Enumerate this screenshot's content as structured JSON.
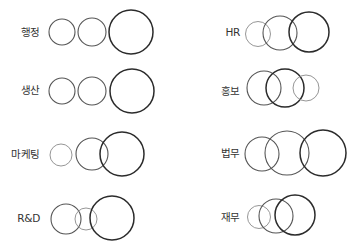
{
  "diagram": {
    "type": "venn-style circle groups by department",
    "stroke_colors": {
      "light": "#8a8a8a",
      "medium": "#555555",
      "dark": "#2b2b2b"
    },
    "groups": [
      {
        "label": "행정",
        "label_pos": {
          "x": 40,
          "y": 36,
          "anchor": "end"
        },
        "circles": [
          {
            "cx": 62,
            "cy": 32,
            "r": 13,
            "tone": "medium"
          },
          {
            "cx": 92,
            "cy": 32,
            "r": 14,
            "tone": "medium"
          },
          {
            "cx": 131,
            "cy": 32,
            "r": 22,
            "tone": "dark"
          }
        ]
      },
      {
        "label": "생산",
        "label_pos": {
          "x": 40,
          "y": 94,
          "anchor": "end"
        },
        "circles": [
          {
            "cx": 62,
            "cy": 91,
            "r": 13,
            "tone": "medium"
          },
          {
            "cx": 92,
            "cy": 91,
            "r": 14,
            "tone": "medium"
          },
          {
            "cx": 132,
            "cy": 91,
            "r": 22,
            "tone": "dark"
          }
        ]
      },
      {
        "label": "마케팅",
        "label_pos": {
          "x": 40,
          "y": 158,
          "anchor": "end"
        },
        "circles": [
          {
            "cx": 61,
            "cy": 155,
            "r": 11,
            "tone": "light"
          },
          {
            "cx": 92,
            "cy": 154,
            "r": 16,
            "tone": "medium"
          },
          {
            "cx": 122,
            "cy": 154,
            "r": 22,
            "tone": "dark"
          }
        ]
      },
      {
        "label": "R&D",
        "label_pos": {
          "x": 40,
          "y": 222,
          "anchor": "end"
        },
        "circles": [
          {
            "cx": 66,
            "cy": 219,
            "r": 15,
            "tone": "medium"
          },
          {
            "cx": 86,
            "cy": 219,
            "r": 11,
            "tone": "light"
          },
          {
            "cx": 112,
            "cy": 218,
            "r": 22,
            "tone": "dark"
          }
        ]
      },
      {
        "label": "HR",
        "label_pos": {
          "x": 240,
          "y": 36,
          "anchor": "end"
        },
        "circles": [
          {
            "cx": 258,
            "cy": 34,
            "r": 12.5,
            "tone": "light"
          },
          {
            "cx": 280,
            "cy": 33,
            "r": 17,
            "tone": "medium"
          },
          {
            "cx": 309,
            "cy": 32,
            "r": 20,
            "tone": "dark"
          }
        ]
      },
      {
        "label": "홍보",
        "label_pos": {
          "x": 240,
          "y": 95,
          "anchor": "end"
        },
        "circles": [
          {
            "cx": 264,
            "cy": 88,
            "r": 17,
            "tone": "medium"
          },
          {
            "cx": 285,
            "cy": 88,
            "r": 19,
            "tone": "dark"
          },
          {
            "cx": 306,
            "cy": 88,
            "r": 13,
            "tone": "light"
          }
        ]
      },
      {
        "label": "법무",
        "label_pos": {
          "x": 240,
          "y": 157,
          "anchor": "end"
        },
        "circles": [
          {
            "cx": 262,
            "cy": 154,
            "r": 17,
            "tone": "medium"
          },
          {
            "cx": 287,
            "cy": 153,
            "r": 22,
            "tone": "medium"
          },
          {
            "cx": 323,
            "cy": 153,
            "r": 23,
            "tone": "dark"
          }
        ]
      },
      {
        "label": "재무",
        "label_pos": {
          "x": 240,
          "y": 221,
          "anchor": "end"
        },
        "circles": [
          {
            "cx": 259,
            "cy": 217,
            "r": 11.5,
            "tone": "light"
          },
          {
            "cx": 276,
            "cy": 216,
            "r": 17,
            "tone": "medium"
          },
          {
            "cx": 295,
            "cy": 215,
            "r": 20,
            "tone": "dark"
          }
        ]
      }
    ]
  }
}
